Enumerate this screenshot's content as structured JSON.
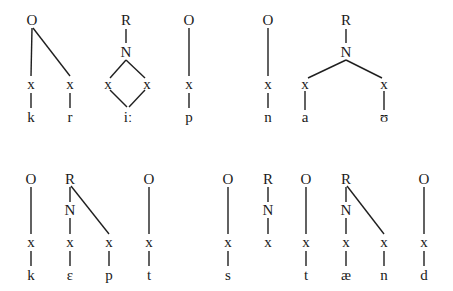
{
  "diagram": {
    "type": "syllable-structure-trees",
    "colors": {
      "line": "#1f1f1f",
      "text": "#1a1a1a",
      "background": "#ffffff"
    },
    "nodes": [
      {
        "id": "t1_O1",
        "label": "O",
        "x": 32,
        "y": 20
      },
      {
        "id": "t1_x1",
        "label": "x",
        "x": 31,
        "y": 84
      },
      {
        "id": "t1_x2",
        "label": "x",
        "x": 70,
        "y": 84
      },
      {
        "id": "t1_k",
        "label": "k",
        "x": 31,
        "y": 117
      },
      {
        "id": "t1_r",
        "label": "r",
        "x": 70,
        "y": 117
      },
      {
        "id": "t1_R1",
        "label": "R",
        "x": 126,
        "y": 20
      },
      {
        "id": "t1_N1",
        "label": "N",
        "x": 126,
        "y": 52
      },
      {
        "id": "t1_x3",
        "label": "x",
        "x": 108,
        "y": 84
      },
      {
        "id": "t1_x4",
        "label": "x",
        "x": 147,
        "y": 84
      },
      {
        "id": "t1_ii",
        "label": "iː",
        "x": 128,
        "y": 117
      },
      {
        "id": "t1_O2",
        "label": "O",
        "x": 189,
        "y": 20
      },
      {
        "id": "t1_x5",
        "label": "x",
        "x": 189,
        "y": 84
      },
      {
        "id": "t1_p",
        "label": "p",
        "x": 189,
        "y": 117
      },
      {
        "id": "t1_O3",
        "label": "O",
        "x": 268,
        "y": 20
      },
      {
        "id": "t1_x6",
        "label": "x",
        "x": 268,
        "y": 84
      },
      {
        "id": "t1_n",
        "label": "n",
        "x": 268,
        "y": 117
      },
      {
        "id": "t1_R2",
        "label": "R",
        "x": 346,
        "y": 20
      },
      {
        "id": "t1_N2",
        "label": "N",
        "x": 346,
        "y": 52
      },
      {
        "id": "t1_x7",
        "label": "x",
        "x": 305,
        "y": 84
      },
      {
        "id": "t1_x8",
        "label": "x",
        "x": 384,
        "y": 84
      },
      {
        "id": "t1_a",
        "label": "a",
        "x": 305,
        "y": 117
      },
      {
        "id": "t1_u",
        "label": "ʊ",
        "x": 384,
        "y": 117
      },
      {
        "id": "b_O1",
        "label": "O",
        "x": 31,
        "y": 179
      },
      {
        "id": "b_x1",
        "label": "x",
        "x": 31,
        "y": 242
      },
      {
        "id": "b_k",
        "label": "k",
        "x": 31,
        "y": 275
      },
      {
        "id": "b_R1",
        "label": "R",
        "x": 70,
        "y": 179
      },
      {
        "id": "b_N1",
        "label": "N",
        "x": 70,
        "y": 210
      },
      {
        "id": "b_x2",
        "label": "x",
        "x": 70,
        "y": 242
      },
      {
        "id": "b_x3",
        "label": "x",
        "x": 109,
        "y": 242
      },
      {
        "id": "b_e",
        "label": "ɛ",
        "x": 70,
        "y": 275
      },
      {
        "id": "b_p",
        "label": "p",
        "x": 109,
        "y": 275
      },
      {
        "id": "b_O2",
        "label": "O",
        "x": 149,
        "y": 179
      },
      {
        "id": "b_x4",
        "label": "x",
        "x": 149,
        "y": 242
      },
      {
        "id": "b_t1",
        "label": "t",
        "x": 149,
        "y": 275
      },
      {
        "id": "b_O3",
        "label": "O",
        "x": 228,
        "y": 179
      },
      {
        "id": "b_x5",
        "label": "x",
        "x": 228,
        "y": 242
      },
      {
        "id": "b_s",
        "label": "s",
        "x": 228,
        "y": 275
      },
      {
        "id": "b_R2",
        "label": "R",
        "x": 268,
        "y": 179
      },
      {
        "id": "b_N2",
        "label": "N",
        "x": 268,
        "y": 210
      },
      {
        "id": "b_x6",
        "label": "x",
        "x": 268,
        "y": 242
      },
      {
        "id": "b_O4",
        "label": "O",
        "x": 306,
        "y": 179
      },
      {
        "id": "b_x7",
        "label": "x",
        "x": 306,
        "y": 242
      },
      {
        "id": "b_t2",
        "label": "t",
        "x": 306,
        "y": 275
      },
      {
        "id": "b_R3",
        "label": "R",
        "x": 346,
        "y": 179
      },
      {
        "id": "b_N3",
        "label": "N",
        "x": 346,
        "y": 210
      },
      {
        "id": "b_x8",
        "label": "x",
        "x": 346,
        "y": 242
      },
      {
        "id": "b_x9",
        "label": "x",
        "x": 384,
        "y": 242
      },
      {
        "id": "b_ae",
        "label": "æ",
        "x": 346,
        "y": 275
      },
      {
        "id": "b_n",
        "label": "n",
        "x": 384,
        "y": 275
      },
      {
        "id": "b_O5",
        "label": "O",
        "x": 424,
        "y": 179
      },
      {
        "id": "b_x10",
        "label": "x",
        "x": 424,
        "y": 242
      },
      {
        "id": "b_d",
        "label": "d",
        "x": 424,
        "y": 275
      }
    ],
    "edges": [
      {
        "x1": 32,
        "y1": 28,
        "x2": 31,
        "y2": 76
      },
      {
        "x1": 33,
        "y1": 28,
        "x2": 70,
        "y2": 76
      },
      {
        "x1": 31,
        "y1": 93,
        "x2": 31,
        "y2": 108
      },
      {
        "x1": 70,
        "y1": 93,
        "x2": 70,
        "y2": 108
      },
      {
        "x1": 126,
        "y1": 29,
        "x2": 126,
        "y2": 43
      },
      {
        "x1": 126,
        "y1": 60,
        "x2": 110,
        "y2": 78
      },
      {
        "x1": 126,
        "y1": 60,
        "x2": 145,
        "y2": 78
      },
      {
        "x1": 110,
        "y1": 90,
        "x2": 127,
        "y2": 107
      },
      {
        "x1": 145,
        "y1": 90,
        "x2": 129,
        "y2": 107
      },
      {
        "x1": 189,
        "y1": 28,
        "x2": 189,
        "y2": 76
      },
      {
        "x1": 189,
        "y1": 93,
        "x2": 189,
        "y2": 108
      },
      {
        "x1": 268,
        "y1": 28,
        "x2": 268,
        "y2": 76
      },
      {
        "x1": 268,
        "y1": 93,
        "x2": 268,
        "y2": 108
      },
      {
        "x1": 346,
        "y1": 29,
        "x2": 346,
        "y2": 43
      },
      {
        "x1": 346,
        "y1": 60,
        "x2": 308,
        "y2": 78
      },
      {
        "x1": 346,
        "y1": 60,
        "x2": 382,
        "y2": 78
      },
      {
        "x1": 305,
        "y1": 91,
        "x2": 305,
        "y2": 110
      },
      {
        "x1": 384,
        "y1": 91,
        "x2": 384,
        "y2": 110
      },
      {
        "x1": 31,
        "y1": 187,
        "x2": 31,
        "y2": 234
      },
      {
        "x1": 31,
        "y1": 251,
        "x2": 31,
        "y2": 266
      },
      {
        "x1": 70,
        "y1": 187,
        "x2": 70,
        "y2": 202
      },
      {
        "x1": 71,
        "y1": 186,
        "x2": 109,
        "y2": 234
      },
      {
        "x1": 70,
        "y1": 218,
        "x2": 70,
        "y2": 234
      },
      {
        "x1": 70,
        "y1": 251,
        "x2": 70,
        "y2": 266
      },
      {
        "x1": 109,
        "y1": 251,
        "x2": 109,
        "y2": 266
      },
      {
        "x1": 149,
        "y1": 187,
        "x2": 149,
        "y2": 234
      },
      {
        "x1": 149,
        "y1": 251,
        "x2": 149,
        "y2": 266
      },
      {
        "x1": 228,
        "y1": 187,
        "x2": 228,
        "y2": 234
      },
      {
        "x1": 228,
        "y1": 251,
        "x2": 228,
        "y2": 266
      },
      {
        "x1": 268,
        "y1": 187,
        "x2": 268,
        "y2": 202
      },
      {
        "x1": 268,
        "y1": 218,
        "x2": 268,
        "y2": 234
      },
      {
        "x1": 306,
        "y1": 187,
        "x2": 306,
        "y2": 234
      },
      {
        "x1": 306,
        "y1": 251,
        "x2": 306,
        "y2": 266
      },
      {
        "x1": 346,
        "y1": 187,
        "x2": 346,
        "y2": 202
      },
      {
        "x1": 347,
        "y1": 186,
        "x2": 384,
        "y2": 234
      },
      {
        "x1": 346,
        "y1": 218,
        "x2": 346,
        "y2": 234
      },
      {
        "x1": 346,
        "y1": 251,
        "x2": 346,
        "y2": 266
      },
      {
        "x1": 384,
        "y1": 251,
        "x2": 384,
        "y2": 266
      },
      {
        "x1": 424,
        "y1": 187,
        "x2": 424,
        "y2": 234
      },
      {
        "x1": 424,
        "y1": 251,
        "x2": 424,
        "y2": 266
      }
    ]
  }
}
